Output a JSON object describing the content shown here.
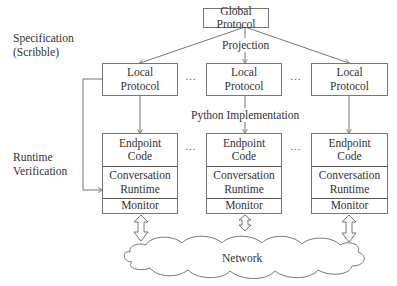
{
  "side_labels": {
    "specification": [
      "Specification",
      "(Scribble)"
    ],
    "runtime": [
      "Runtime",
      "Verification"
    ]
  },
  "global_protocol": "Global Protocol",
  "edge_labels": {
    "projection": "Projection",
    "implementation": "Python Implementation"
  },
  "local_protocols": [
    {
      "line1": "Local",
      "line2": "Protocol"
    },
    {
      "line1": "Local",
      "line2": "Protocol"
    },
    {
      "line1": "Local",
      "line2": "Protocol"
    }
  ],
  "endpoints": [
    {
      "code": [
        "Endpoint",
        "Code"
      ],
      "runtime": [
        "Conversation",
        "Runtime"
      ],
      "monitor": "Monitor"
    },
    {
      "code": [
        "Endpoint",
        "Code"
      ],
      "runtime": [
        "Conversation",
        "Runtime"
      ],
      "monitor": "Monitor"
    },
    {
      "code": [
        "Endpoint",
        "Code"
      ],
      "runtime": [
        "Conversation",
        "Runtime"
      ],
      "monitor": "Monitor"
    }
  ],
  "ellipsis": "…",
  "network": "Network"
}
